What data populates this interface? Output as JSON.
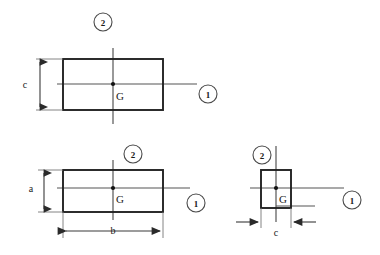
{
  "figure": {
    "background_color": "#ffffff",
    "outline_color": "#222222",
    "axis_color": "#555555",
    "dimension_color": "#3a3a3a",
    "callout_color": "#4a4a4a",
    "centroid_color": "#111111"
  },
  "sections": [
    {
      "id": "top-left-section",
      "centroid_label": "G",
      "axis_1_label": "1",
      "axis_2_label": "2",
      "dimensions": [
        {
          "name": "height-dimension",
          "label": "c",
          "orientation": "vertical"
        }
      ]
    },
    {
      "id": "bottom-left-section",
      "centroid_label": "G",
      "axis_1_label": "1",
      "axis_2_label": "2",
      "dimensions": [
        {
          "name": "height-dimension",
          "label": "a",
          "orientation": "vertical"
        },
        {
          "name": "width-dimension",
          "label": "b",
          "orientation": "horizontal"
        }
      ]
    },
    {
      "id": "bottom-right-section",
      "centroid_label": "G",
      "axis_1_label": "1",
      "axis_2_label": "2",
      "dimensions": [
        {
          "name": "width-dimension",
          "label": "c",
          "orientation": "horizontal"
        }
      ]
    }
  ]
}
